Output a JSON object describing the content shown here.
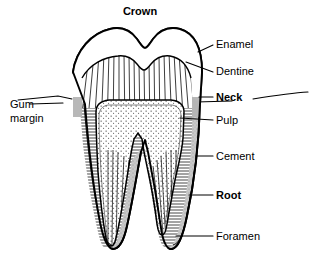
{
  "figure": {
    "title_label": "Crown",
    "background_color": "#ffffff",
    "line_color": "#000000",
    "cement_fill_color": "#c8c8c8",
    "enamel_fill_color": "#ffffff",
    "pulp_fill_color": "#ffffff"
  },
  "labels": {
    "crown": {
      "text": "Crown",
      "bold": true,
      "x": 140,
      "y": 15
    },
    "enamel": {
      "text": "Enamel",
      "bold": false,
      "x": 216,
      "y": 48
    },
    "dentine": {
      "text": "Dentine",
      "bold": false,
      "x": 216,
      "y": 75
    },
    "neck": {
      "text": "Neck",
      "bold": true,
      "x": 216,
      "y": 101
    },
    "pulp": {
      "text": "Pulp",
      "bold": false,
      "x": 216,
      "y": 124
    },
    "cement": {
      "text": "Cement",
      "bold": false,
      "x": 216,
      "y": 160
    },
    "root": {
      "text": "Root",
      "bold": true,
      "x": 216,
      "y": 199
    },
    "foramen": {
      "text": "Foramen",
      "bold": false,
      "x": 216,
      "y": 240
    },
    "gum_margin_line1": {
      "text": "Gum",
      "bold": false,
      "x": 10,
      "y": 108
    },
    "gum_margin_line2": {
      "text": "margin",
      "bold": false,
      "x": 10,
      "y": 122
    }
  },
  "structures": [
    {
      "name": "enamel",
      "description": "outer white cap of the crown"
    },
    {
      "name": "dentine",
      "description": "radially hatched layer beneath enamel"
    },
    {
      "name": "pulp",
      "description": "stippled central chamber and root canals"
    },
    {
      "name": "cement",
      "description": "grey outer layer covering the root"
    },
    {
      "name": "neck",
      "description": "constriction at the gum line"
    },
    {
      "name": "root",
      "description": "two tapering roots embedded below gum"
    },
    {
      "name": "foramen",
      "description": "opening at the apex of the root tip"
    },
    {
      "name": "gum-margin",
      "description": "horizontal gum line meeting the neck"
    }
  ]
}
